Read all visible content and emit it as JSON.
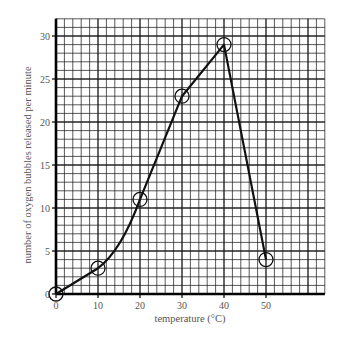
{
  "chart_data": {
    "type": "line",
    "title": "",
    "xlabel": "temperature (°C)",
    "ylabel": "number of oxygen bubbles released per minute",
    "x": [
      0,
      10,
      20,
      30,
      40,
      50
    ],
    "series": [
      {
        "name": "oxygen bubbles",
        "values": [
          0,
          3,
          11,
          23,
          29,
          4
        ],
        "marker": "open-circle"
      }
    ],
    "xticks": [
      0,
      10,
      20,
      30,
      40,
      50
    ],
    "yticks": [
      0,
      5,
      10,
      15,
      20,
      25,
      30
    ],
    "xlim": [
      0,
      64
    ],
    "ylim": [
      0,
      32
    ],
    "grid": true,
    "grid_minor_x": 2,
    "grid_minor_y": 1,
    "legend": null,
    "colors": {
      "line": "#111111",
      "grid": "#1a1a1a",
      "text": "#555555",
      "background": "#ffffff"
    }
  }
}
